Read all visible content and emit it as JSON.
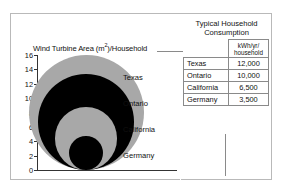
{
  "figure": {
    "axis_title": "Wind Turbine Area (m",
    "axis_title_sup": "2",
    "axis_title_tail": ")/Household"
  },
  "panel": {
    "title_line1": "Typical Household",
    "title_line2": "Consumption",
    "column_blank": "",
    "column_unit_line1": "kWh/yr/",
    "column_unit_line2": "household",
    "rows": [
      {
        "region": "Texas",
        "value": "12,000"
      },
      {
        "region": "Ontario",
        "value": "10,000"
      },
      {
        "region": "California",
        "value": "6,500"
      },
      {
        "region": "Germany",
        "value": "3,500"
      }
    ]
  },
  "chart_data": {
    "type": "bubble",
    "title": "Wind Turbine Area (m2)/Household",
    "ylabel": "Wind Turbine Area (m2)/Household",
    "xlabel": "",
    "ylim": [
      0,
      16
    ],
    "yticks": [
      "0",
      "2",
      "4",
      "6",
      "8",
      "10",
      "12",
      "14",
      "16"
    ],
    "grid": false,
    "legend": "inline-labels-right",
    "note": "Nested bottom-aligned circles; circle diameter equals the wind turbine area value on the y-axis.",
    "categories": [
      "Texas",
      "Ontario",
      "California",
      "Germany"
    ],
    "values": [
      16,
      13.3,
      8.7,
      4.7
    ],
    "consumption_kwh_per_yr_per_household": [
      12000,
      10000,
      6500,
      3500
    ],
    "colors": [
      "#a8a8a8",
      "#000000",
      "#a8a8a8",
      "#000000"
    ],
    "series": [
      {
        "name": "Wind Turbine Area (m2)/Household",
        "values": [
          16,
          13.3,
          8.7,
          4.7
        ]
      }
    ]
  },
  "bubble_labels": [
    {
      "label": "Texas"
    },
    {
      "label": "Ontario"
    },
    {
      "label": "California"
    },
    {
      "label": "Germany"
    }
  ]
}
